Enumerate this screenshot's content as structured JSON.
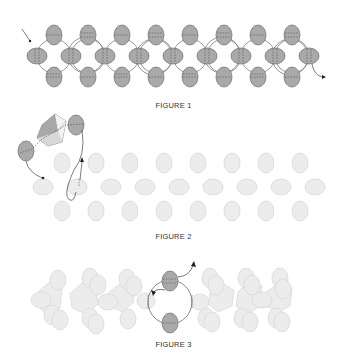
{
  "figures": [
    {
      "id": "figure-1",
      "caption": "FIGURE 1",
      "description": "Right-angle weave band of dark grey oval beads with thread path"
    },
    {
      "id": "figure-2",
      "caption": "FIGURE 2",
      "description": "Faded bead band with crystal added between two dark beads"
    },
    {
      "id": "figure-3",
      "caption": "FIGURE 3",
      "description": "Embellished band with one dark unit highlighted and thread loop"
    }
  ],
  "colors": {
    "dark_bead": "#a9a9a9",
    "dark_bead_stroke": "#6a6a6a",
    "light_bead": "#ececec",
    "light_bead_stroke": "#d0d0d0",
    "thread": "#555555"
  }
}
